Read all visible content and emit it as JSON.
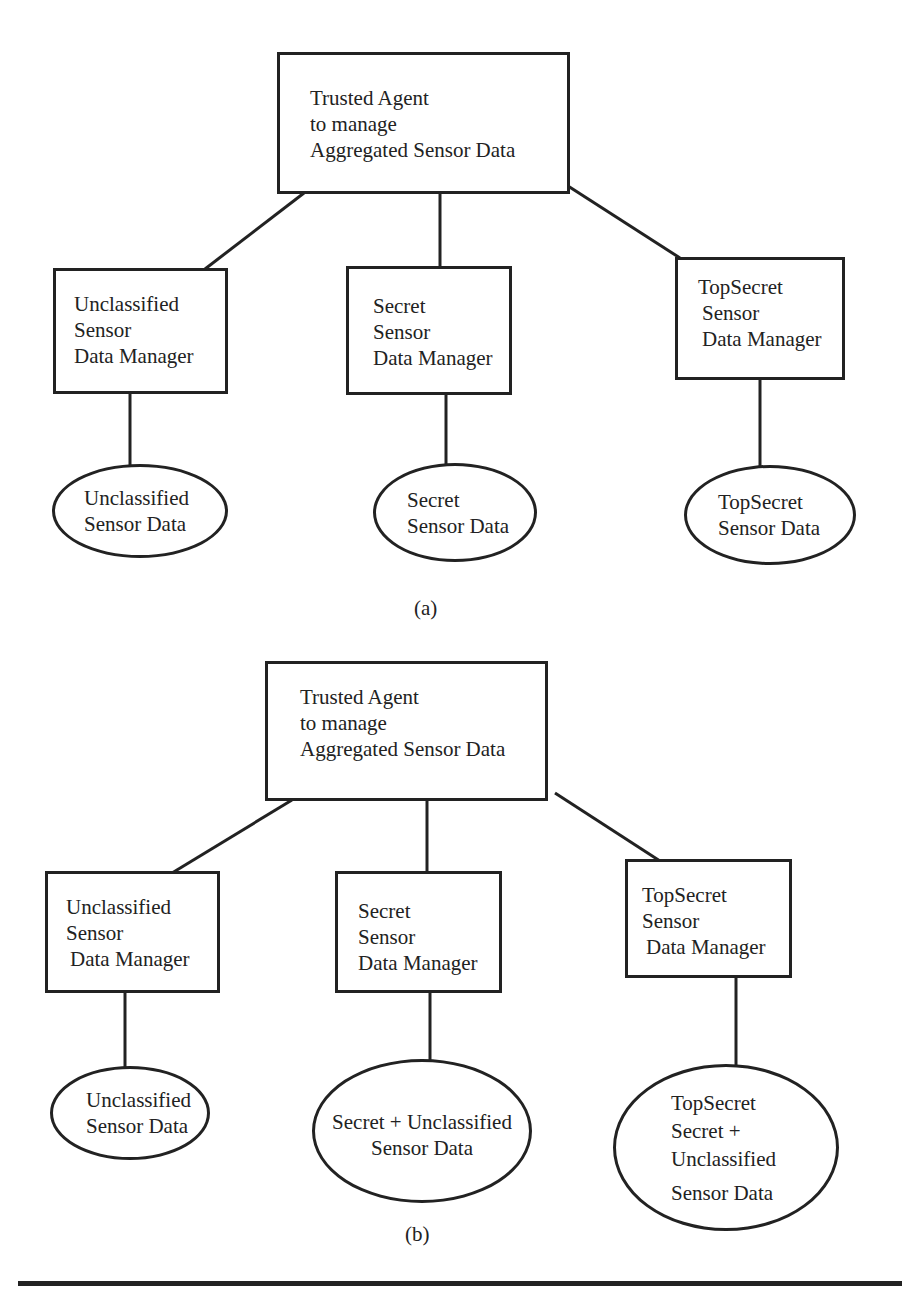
{
  "diagram_a": {
    "caption": "(a)",
    "root": {
      "lines": [
        "Trusted Agent",
        "to manage",
        "Aggregated Sensor Data"
      ]
    },
    "managers": [
      {
        "lines": [
          "Unclassified",
          "Sensor",
          "Data Manager"
        ]
      },
      {
        "lines": [
          "Secret",
          "Sensor",
          "Data Manager"
        ]
      },
      {
        "lines": [
          "TopSecret",
          "Sensor",
          "Data Manager"
        ]
      }
    ],
    "data_stores": [
      {
        "lines": [
          "Unclassified",
          "Sensor Data"
        ]
      },
      {
        "lines": [
          "Secret",
          "Sensor Data"
        ]
      },
      {
        "lines": [
          "TopSecret",
          "Sensor Data"
        ]
      }
    ]
  },
  "diagram_b": {
    "caption": "(b)",
    "root": {
      "lines": [
        "Trusted Agent",
        "to manage",
        "Aggregated Sensor Data"
      ]
    },
    "managers": [
      {
        "lines": [
          "Unclassified",
          "Sensor",
          "Data Manager"
        ]
      },
      {
        "lines": [
          "Secret",
          "Sensor",
          "Data Manager"
        ]
      },
      {
        "lines": [
          "TopSecret",
          "Sensor",
          "Data Manager"
        ]
      }
    ],
    "data_stores": [
      {
        "lines": [
          "Unclassified",
          "Sensor Data"
        ]
      },
      {
        "lines": [
          "Secret + Unclassified",
          "Sensor Data"
        ]
      },
      {
        "lines": [
          "TopSecret",
          "Secret +",
          "Unclassified",
          "Sensor Data"
        ]
      }
    ]
  }
}
